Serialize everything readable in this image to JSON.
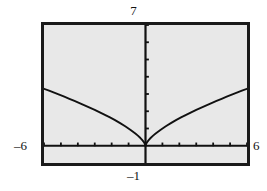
{
  "screen": {
    "background_color": "#e8e8e8",
    "border_color": "#1a1a1a",
    "axis_color": "#111111",
    "curve_color": "#111111"
  },
  "window_labels": {
    "ymax": "7",
    "ymin": "–1",
    "xmin": "–6",
    "xmax": "6"
  },
  "chart_data": {
    "type": "line",
    "title": "",
    "subtitle": "",
    "xlabel": "",
    "ylabel": "",
    "grid": false,
    "legend": null,
    "axis_style": "graphing-calculator",
    "xlim": [
      -6,
      6
    ],
    "ylim": [
      -1,
      7
    ],
    "xticks": [
      -6,
      -5,
      -4,
      -3,
      -2,
      -1,
      0,
      1,
      2,
      3,
      4,
      5,
      6
    ],
    "yticks": [
      0,
      1,
      2,
      3,
      4,
      5,
      6,
      7
    ],
    "tick_labels_shown": false,
    "window_corner_labels": {
      "top": "7",
      "bottom": "–1",
      "left": "–6",
      "right": "6"
    },
    "series": [
      {
        "name": "y = x^(2/3)",
        "expression": "y = cube_root(x^2)",
        "x": [
          -6.0,
          -5.7,
          -5.4,
          -5.1,
          -4.8,
          -4.5,
          -4.2,
          -3.9,
          -3.6,
          -3.3,
          -3.0,
          -2.7,
          -2.4,
          -2.1,
          -1.8,
          -1.5,
          -1.2,
          -0.9,
          -0.6,
          -0.45,
          -0.3,
          -0.2,
          -0.12,
          -0.06,
          -0.02,
          0.0,
          0.02,
          0.06,
          0.12,
          0.2,
          0.3,
          0.45,
          0.6,
          0.9,
          1.2,
          1.5,
          1.8,
          2.1,
          2.4,
          2.7,
          3.0,
          3.3,
          3.6,
          3.9,
          4.2,
          4.5,
          4.8,
          5.1,
          5.4,
          5.7,
          6.0
        ],
        "y": [
          3.302,
          3.192,
          3.079,
          2.963,
          2.844,
          2.724,
          2.6,
          2.473,
          2.342,
          2.208,
          2.08,
          1.935,
          1.79,
          1.641,
          1.487,
          1.31,
          1.129,
          0.932,
          0.711,
          0.587,
          0.448,
          0.342,
          0.243,
          0.153,
          0.074,
          0.0,
          0.074,
          0.153,
          0.243,
          0.342,
          0.448,
          0.587,
          0.711,
          0.932,
          1.129,
          1.31,
          1.487,
          1.641,
          1.79,
          1.935,
          2.08,
          2.208,
          2.342,
          2.473,
          2.6,
          2.724,
          2.844,
          2.963,
          3.079,
          3.192,
          3.302
        ]
      }
    ],
    "annotations": [
      {
        "text": "cusp at origin",
        "x": 0,
        "y": 0
      }
    ]
  }
}
